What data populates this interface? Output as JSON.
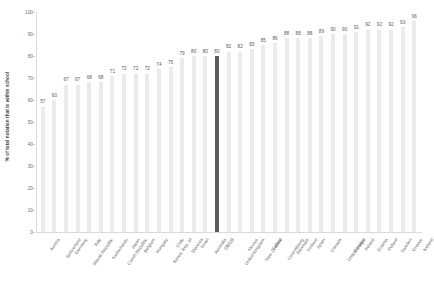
{
  "chart_data": {
    "type": "bar",
    "title": "",
    "subtitle": "",
    "xlabel": "",
    "ylabel": "% of total notation that is within school",
    "ylim": [
      0,
      100
    ],
    "ytick_step": 10,
    "yticks": [
      0,
      10,
      20,
      30,
      40,
      50,
      60,
      70,
      80,
      90,
      100
    ],
    "grid": false,
    "legend": "none",
    "highlight_category": "OECD",
    "highlight_color": "#595959",
    "bar_color": "#eceaea",
    "categories": [
      "Austria",
      "Switzerland",
      "Germany",
      "Slovak Republic",
      "Italy",
      "Netherlands",
      "Czech Republic",
      "Japan",
      "Belgium",
      "Hungary",
      "Korea, Rep. of",
      "Chile",
      "Slovenia",
      "Israel",
      "Australia",
      "OECD",
      "United Kingdom",
      "Mexico",
      "New Zealand",
      "Turkey",
      "Luxembourg",
      "Denmark",
      "Finland",
      "Spain",
      "Canada",
      "United States",
      "Portugal",
      "Ireland",
      "Estonia",
      "Poland",
      "Sweden",
      "Greece",
      "Iceland"
    ],
    "values": [
      57,
      60,
      67,
      67,
      68,
      68,
      71,
      72,
      72,
      72,
      74,
      75,
      79,
      80,
      80,
      80,
      82,
      82,
      83,
      85,
      86,
      88,
      88,
      88,
      89,
      90,
      90,
      91,
      92,
      92,
      92,
      93,
      96
    ],
    "value_labels": [
      "57",
      "60",
      "67",
      "67",
      "68",
      "68",
      "71",
      "72",
      "72",
      "72",
      "74",
      "75",
      "79",
      "80",
      "80",
      "80",
      "82",
      "82",
      "83",
      "85",
      "86",
      "88",
      "88",
      "88",
      "89",
      "90",
      "90",
      "91",
      "92",
      "92",
      "92",
      "93",
      "96"
    ]
  }
}
